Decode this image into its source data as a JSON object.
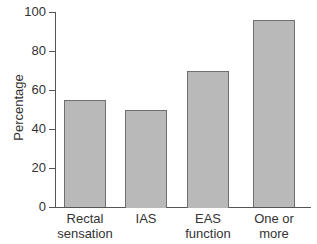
{
  "chart_data": {
    "type": "bar",
    "title": "",
    "xlabel": "",
    "ylabel": "Percentage",
    "categories": [
      "Rectal\nsensation",
      "IAS",
      "EAS\nfunction",
      "One or\nmore"
    ],
    "values": [
      55,
      50,
      70,
      96
    ],
    "ylim": [
      0,
      100
    ],
    "yticks": [
      0,
      20,
      40,
      60,
      80,
      100
    ],
    "grid": false,
    "legend": null,
    "colors": {
      "bar_fill": "#b9b9b9",
      "bar_edge": "#6f6f6f",
      "axis": "#555555"
    }
  },
  "labels": {
    "ylabel": "Percentage",
    "yticks": [
      "0",
      "20",
      "40",
      "60",
      "80",
      "100"
    ],
    "categories": [
      "Rectal\nsensation",
      "IAS",
      "EAS\nfunction",
      "One or\nmore"
    ]
  }
}
